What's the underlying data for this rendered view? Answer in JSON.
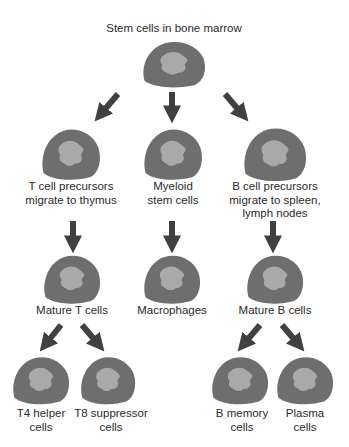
{
  "title": "Stem cells in bone marrow",
  "colors": {
    "cell_outer": "#6e6e6e",
    "cell_inner": "#a9a9a9",
    "arrow": "#404040",
    "text": "#2a2a2a"
  },
  "nodes": [
    {
      "id": "myeloid",
      "lines": [
        "Myeloid",
        "stem cells"
      ]
    },
    {
      "id": "t_precursors",
      "lines": [
        "T cell precursors",
        "migrate to thymus"
      ]
    },
    {
      "id": "b_precursors",
      "lines": [
        "B cell precursors",
        "migrate to spleen,",
        "lymph nodes"
      ]
    },
    {
      "id": "mature_t",
      "lines": [
        "Mature T cells"
      ]
    },
    {
      "id": "macrophages",
      "lines": [
        "Macrophages"
      ]
    },
    {
      "id": "mature_b",
      "lines": [
        "Mature B cells"
      ]
    },
    {
      "id": "t4_helper",
      "lines": [
        "T4 helper",
        "cells"
      ]
    },
    {
      "id": "t8_suppressor",
      "lines": [
        "T8 suppressor",
        "cells"
      ]
    },
    {
      "id": "b_memory",
      "lines": [
        "B memory",
        "cells"
      ]
    },
    {
      "id": "plasma",
      "lines": [
        "Plasma",
        "cells"
      ]
    }
  ],
  "edges": [
    [
      "stem",
      "t_precursors"
    ],
    [
      "stem",
      "myeloid"
    ],
    [
      "stem",
      "b_precursors"
    ],
    [
      "t_precursors",
      "mature_t"
    ],
    [
      "myeloid",
      "macrophages"
    ],
    [
      "b_precursors",
      "mature_b"
    ],
    [
      "mature_t",
      "t4_helper"
    ],
    [
      "mature_t",
      "t8_suppressor"
    ],
    [
      "mature_b",
      "b_memory"
    ],
    [
      "mature_b",
      "plasma"
    ]
  ]
}
